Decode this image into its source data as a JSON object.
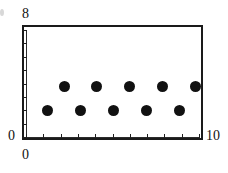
{
  "figure": {
    "type": "scatter-plot-figure",
    "background_color": "#ffffff",
    "foreground_color": "#111111"
  },
  "axes": {
    "y_min_label": "0",
    "y_max_label": "8",
    "x_min_label": "0",
    "x_max_label": "10"
  },
  "chart_data": {
    "type": "scatter",
    "title": "",
    "xlabel": "",
    "ylabel": "",
    "xlim": [
      0,
      10
    ],
    "ylim": [
      0,
      8
    ],
    "xticks": [
      0,
      1,
      2,
      3,
      4,
      5,
      6,
      7,
      8,
      9,
      10
    ],
    "yticks": [
      0,
      1,
      2,
      3,
      4,
      5,
      6,
      7,
      8
    ],
    "xtick_labels": [
      "0",
      "",
      "",
      "",
      "",
      "",
      "",
      "",
      "",
      "",
      "10"
    ],
    "ytick_labels": [
      "0",
      "",
      "",
      "",
      "",
      "",
      "",
      "",
      "8"
    ],
    "grid": false,
    "legend": null,
    "marker": "filled-circle",
    "marker_color": "#111111",
    "marker_size_px": 11,
    "series": [
      {
        "name": "lower row",
        "x": [
          1.25,
          3.15,
          5.05,
          6.95,
          8.85
        ],
        "y": [
          2,
          2,
          2,
          2,
          2
        ]
      },
      {
        "name": "upper row",
        "x": [
          2.2,
          4.1,
          6.0,
          7.9,
          9.8
        ],
        "y": [
          3.8,
          3.8,
          3.8,
          3.8,
          3.8
        ]
      }
    ],
    "points": [
      {
        "x": 1.25,
        "y": 2,
        "row": "lower"
      },
      {
        "x": 2.2,
        "y": 3.8,
        "row": "upper"
      },
      {
        "x": 3.15,
        "y": 2,
        "row": "lower"
      },
      {
        "x": 4.1,
        "y": 3.8,
        "row": "upper"
      },
      {
        "x": 5.05,
        "y": 2,
        "row": "lower"
      },
      {
        "x": 6.0,
        "y": 3.8,
        "row": "upper"
      },
      {
        "x": 6.95,
        "y": 2,
        "row": "lower"
      },
      {
        "x": 7.9,
        "y": 3.8,
        "row": "upper"
      },
      {
        "x": 8.85,
        "y": 2,
        "row": "lower"
      },
      {
        "x": 9.8,
        "y": 3.8,
        "row": "upper"
      }
    ]
  }
}
